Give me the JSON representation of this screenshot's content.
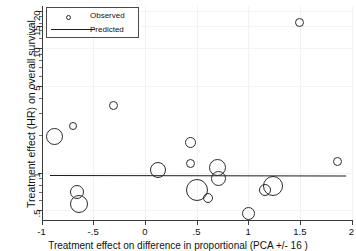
{
  "chart_data": {
    "type": "scatter",
    "title": "",
    "subtitle": "",
    "xlabel": "Treatment effect on difference in proportional (PCA +/- 16 )",
    "ylabel": "Treatment effect (HR) on overall survival",
    "yscale": "log",
    "xscale": "linear",
    "xlim": [
      -1,
      2
    ],
    "ylim": [
      0.42,
      22
    ],
    "grid": true,
    "grid_note": "faint light-grey gridlines at tick positions",
    "legend": {
      "position": "top-left",
      "entries": [
        {
          "label": "Observed",
          "marker": "circle"
        },
        {
          "label": "Predicted",
          "marker": "line"
        }
      ]
    },
    "xticks": [
      -1,
      -0.5,
      0,
      0.5,
      1,
      1.5,
      2
    ],
    "xticklabels": [
      "-1",
      "-.5",
      "0",
      ".5",
      "1",
      "1.5",
      "2"
    ],
    "yticks": [
      0.5,
      1,
      5,
      10,
      15,
      20
    ],
    "yticklabels": [
      ".5",
      "1",
      "5",
      "10",
      "15",
      "20"
    ],
    "series": [
      {
        "name": "Observed",
        "marker": "open-circle",
        "size_encodes": "study weight",
        "points": [
          {
            "x": -0.87,
            "y": 1.95,
            "size": 17
          },
          {
            "x": -0.7,
            "y": 2.35,
            "size": 8
          },
          {
            "x": -0.66,
            "y": 0.7,
            "size": 14
          },
          {
            "x": -0.64,
            "y": 0.56,
            "size": 18
          },
          {
            "x": -0.3,
            "y": 3.45,
            "size": 9
          },
          {
            "x": 0.13,
            "y": 1.05,
            "size": 16
          },
          {
            "x": 0.44,
            "y": 1.75,
            "size": 11
          },
          {
            "x": 0.44,
            "y": 1.18,
            "size": 9
          },
          {
            "x": 0.5,
            "y": 0.72,
            "size": 22
          },
          {
            "x": 0.61,
            "y": 0.62,
            "size": 10
          },
          {
            "x": 0.7,
            "y": 1.1,
            "size": 17
          },
          {
            "x": 0.71,
            "y": 0.9,
            "size": 15
          },
          {
            "x": 1.0,
            "y": 0.47,
            "size": 13
          },
          {
            "x": 1.16,
            "y": 0.73,
            "size": 12
          },
          {
            "x": 1.24,
            "y": 0.78,
            "size": 20
          },
          {
            "x": 1.5,
            "y": 16.0,
            "size": 9
          },
          {
            "x": 1.86,
            "y": 1.22,
            "size": 9
          }
        ]
      },
      {
        "name": "Predicted",
        "marker": "line",
        "line": {
          "x_start": -0.92,
          "y_start": 0.96,
          "x_end": 1.94,
          "y_end": 0.95
        }
      }
    ]
  }
}
